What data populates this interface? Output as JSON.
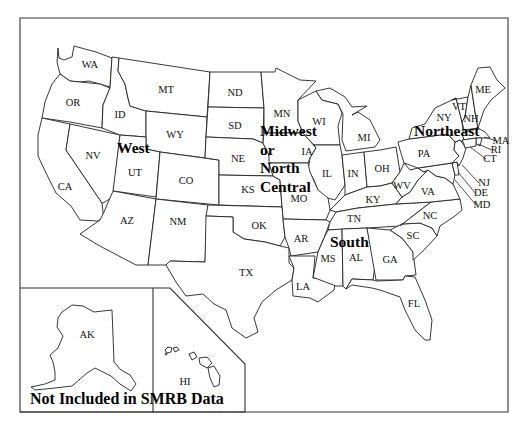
{
  "map": {
    "title": "US Census Regions Map",
    "note": "Not Included in SMRB Data",
    "regions": [
      {
        "id": "west",
        "label": "West",
        "x": 117,
        "y": 153
      },
      {
        "id": "midwest",
        "label": "Midwest",
        "x": 260,
        "y": 136
      },
      {
        "id": "midwest-or",
        "label": "or",
        "x": 260,
        "y": 155
      },
      {
        "id": "midwest-north",
        "label": "North",
        "x": 260,
        "y": 173
      },
      {
        "id": "midwest-central",
        "label": "Central",
        "x": 260,
        "y": 192
      },
      {
        "id": "northeast",
        "label": "Northeast",
        "x": 414,
        "y": 136
      },
      {
        "id": "south",
        "label": "South",
        "x": 330,
        "y": 247
      }
    ],
    "states": [
      {
        "abbr": "WA",
        "x": 90,
        "y": 66
      },
      {
        "abbr": "OR",
        "x": 73,
        "y": 104
      },
      {
        "abbr": "CA",
        "x": 65,
        "y": 188
      },
      {
        "abbr": "NV",
        "x": 93,
        "y": 157
      },
      {
        "abbr": "ID",
        "x": 120,
        "y": 116
      },
      {
        "abbr": "MT",
        "x": 166,
        "y": 91
      },
      {
        "abbr": "WY",
        "x": 175,
        "y": 136
      },
      {
        "abbr": "UT",
        "x": 135,
        "y": 174
      },
      {
        "abbr": "CO",
        "x": 186,
        "y": 182
      },
      {
        "abbr": "AZ",
        "x": 127,
        "y": 222
      },
      {
        "abbr": "NM",
        "x": 178,
        "y": 223
      },
      {
        "abbr": "ND",
        "x": 235,
        "y": 94
      },
      {
        "abbr": "SD",
        "x": 235,
        "y": 127
      },
      {
        "abbr": "NE",
        "x": 238,
        "y": 160
      },
      {
        "abbr": "KS",
        "x": 248,
        "y": 191
      },
      {
        "abbr": "OK",
        "x": 259,
        "y": 227
      },
      {
        "abbr": "TX",
        "x": 246,
        "y": 274
      },
      {
        "abbr": "MN",
        "x": 282,
        "y": 115
      },
      {
        "abbr": "WI",
        "x": 319,
        "y": 123
      },
      {
        "abbr": "MI",
        "x": 364,
        "y": 139
      },
      {
        "abbr": "IA",
        "x": 307,
        "y": 153
      },
      {
        "abbr": "IL",
        "x": 327,
        "y": 175
      },
      {
        "abbr": "IN",
        "x": 353,
        "y": 175
      },
      {
        "abbr": "OH",
        "x": 382,
        "y": 170
      },
      {
        "abbr": "MO",
        "x": 299,
        "y": 200
      },
      {
        "abbr": "KY",
        "x": 373,
        "y": 201
      },
      {
        "abbr": "TN",
        "x": 354,
        "y": 220
      },
      {
        "abbr": "AR",
        "x": 301,
        "y": 240
      },
      {
        "abbr": "MS",
        "x": 328,
        "y": 260
      },
      {
        "abbr": "AL",
        "x": 356,
        "y": 259
      },
      {
        "abbr": "GA",
        "x": 390,
        "y": 261
      },
      {
        "abbr": "LA",
        "x": 303,
        "y": 288
      },
      {
        "abbr": "FL",
        "x": 414,
        "y": 305
      },
      {
        "abbr": "SC",
        "x": 413,
        "y": 237
      },
      {
        "abbr": "NC",
        "x": 430,
        "y": 217
      },
      {
        "abbr": "VA",
        "x": 428,
        "y": 193
      },
      {
        "abbr": "WV",
        "x": 402,
        "y": 187
      },
      {
        "abbr": "PA",
        "x": 424,
        "y": 155
      },
      {
        "abbr": "NY",
        "x": 444,
        "y": 119
      },
      {
        "abbr": "VT",
        "x": 459,
        "y": 108
      },
      {
        "abbr": "NH",
        "x": 471,
        "y": 120
      },
      {
        "abbr": "ME",
        "x": 483,
        "y": 91
      },
      {
        "abbr": "MA",
        "x": 501,
        "y": 142
      },
      {
        "abbr": "RI",
        "x": 496,
        "y": 151
      },
      {
        "abbr": "CT",
        "x": 490,
        "y": 160
      },
      {
        "abbr": "NJ",
        "x": 484,
        "y": 184
      },
      {
        "abbr": "DE",
        "x": 481,
        "y": 194
      },
      {
        "abbr": "MD",
        "x": 482,
        "y": 206
      },
      {
        "abbr": "AK",
        "x": 87,
        "y": 336
      },
      {
        "abbr": "HI",
        "x": 185,
        "y": 383
      }
    ],
    "colors": {
      "background": "#ffffff",
      "border": "#222222",
      "text": "#111111"
    }
  }
}
